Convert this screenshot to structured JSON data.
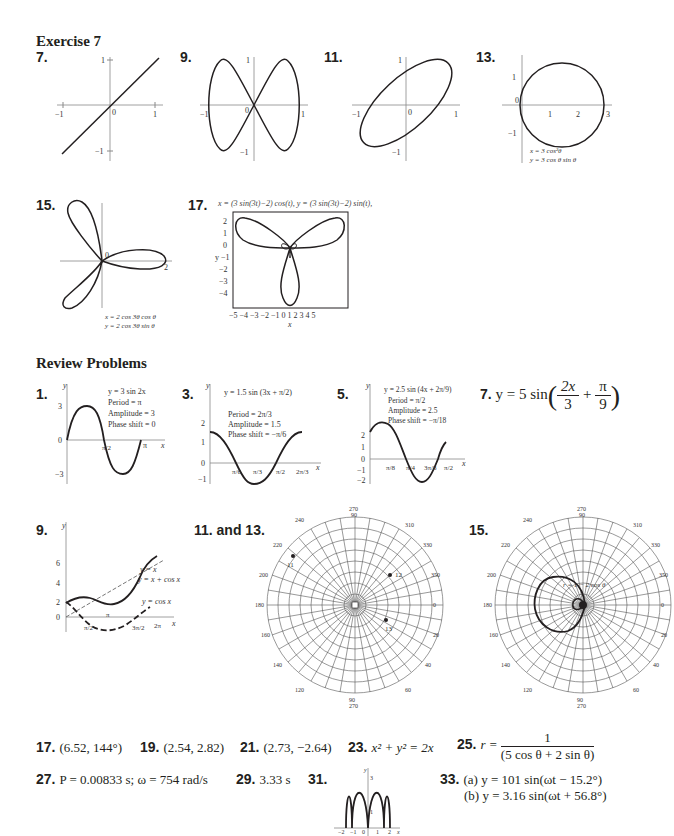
{
  "sections": {
    "exercise": "Exercise 7",
    "review": "Review Problems"
  },
  "exercise_figures": {
    "n7": {
      "label": "7.",
      "ticks": [
        "−1",
        "0",
        "1",
        "1",
        "−1"
      ]
    },
    "n9": {
      "label": "9.",
      "ticks": [
        "−1",
        "0",
        "1",
        "1",
        "−1"
      ]
    },
    "n11": {
      "label": "11.",
      "ticks": [
        "−1",
        "0",
        "1",
        "1",
        "−1"
      ]
    },
    "n13": {
      "label": "13.",
      "ticks": [
        "0",
        "1",
        "2",
        "3",
        "1",
        "−1"
      ],
      "eq1": "x = 3 cos²θ",
      "eq2": "y = 3 cos θ sin θ"
    },
    "n15": {
      "label": "15.",
      "ticks": [
        "0",
        "2"
      ],
      "eq1": "x = 2 cos 3θ cos θ",
      "eq2": "y = 2 cos 3θ sin θ"
    },
    "n17": {
      "label": "17.",
      "title": "x = (3 sin(3t)−2) cos(t), y = (3 sin(3t)−2) sin(t),",
      "ylabel": "y",
      "xlabel": "x",
      "yticks": [
        "2",
        "1",
        "0",
        "−1",
        "−2",
        "−3",
        "−4"
      ],
      "xticks": [
        "−5",
        "−4",
        "−3",
        "−2",
        "−1",
        "0",
        "1",
        "2",
        "3",
        "4",
        "5"
      ]
    }
  },
  "review_figures": {
    "n1": {
      "label": "1.",
      "eq": "y = 3 sin 2x",
      "period": "Period = π",
      "amp": "Amplitude = 3",
      "phase": "Phase shift = 0",
      "y": "y",
      "x": "x",
      "ticks": [
        "3",
        "0",
        "−3",
        "π/2",
        "π"
      ]
    },
    "n3": {
      "label": "3.",
      "eq": "y = 1.5 sin (3x + π/2)",
      "period": "Period = 2π/3",
      "amp": "Amplitude = 1.5",
      "phase": "Phase shift = −π/6",
      "y": "y",
      "x": "x",
      "ticks": [
        "2",
        "1",
        "0",
        "−1",
        "π/6",
        "π/3",
        "π/2",
        "2π/3"
      ]
    },
    "n5": {
      "label": "5.",
      "eq": "y = 2.5 sin (4x + 2π/9)",
      "period": "Period = π/2",
      "amp": "Amplitude = 2.5",
      "phase": "Phase shift = −π/18",
      "y": "y",
      "x": "x",
      "ticks": [
        "2",
        "1",
        "0",
        "−1",
        "−2",
        "π/8",
        "π/4",
        "3π/8",
        "π/2"
      ]
    },
    "n7": {
      "label": "7.",
      "lhs": "y = 5 sin",
      "num1": "2x",
      "den1": "3",
      "plus": "+",
      "num2": "π",
      "den2": "9"
    },
    "n9": {
      "label": "9.",
      "y": "y",
      "x": "x",
      "ticks": [
        "6",
        "4",
        "2",
        "0",
        "π/2",
        "π",
        "3π/2",
        "2π"
      ],
      "legend": [
        "y = x",
        "y = x + cos x",
        "y = cos x"
      ]
    },
    "n11_13": {
      "label": "11. and 13.",
      "points": [
        "11",
        "12",
        "13"
      ],
      "center": "0"
    },
    "n15": {
      "label": "15.",
      "curve": "r = 1 − 2 cos θ"
    },
    "polar_outer": [
      "270\n90",
      "280\n80",
      "290\n70",
      "300\n60",
      "310\n50",
      "320\n40",
      "330\n30",
      "340\n20",
      "350\n10",
      "0",
      "10\n350",
      "20\n340",
      "30\n330",
      "40\n320",
      "50\n310",
      "60\n300",
      "70\n290",
      "80\n280",
      "90\n270",
      "100\n260",
      "110\n250",
      "120\n240",
      "130\n230",
      "140\n220",
      "150\n210",
      "160\n200",
      "170\n190",
      "180",
      "190\n170",
      "200\n160",
      "210\n150",
      "220\n140",
      "230\n130",
      "240\n120",
      "250\n110",
      "260\n100"
    ]
  },
  "answers": {
    "a17": {
      "n": "17.",
      "v": "(6.52, 144°)"
    },
    "a19": {
      "n": "19.",
      "v": "(2.54, 2.82)"
    },
    "a21": {
      "n": "21.",
      "v": "(2.73, −2.64)"
    },
    "a23": {
      "n": "23.",
      "v": "x² + y² = 2x"
    },
    "a25": {
      "n": "25.",
      "lhs": "r =",
      "num": "1",
      "den": "(5 cos θ + 2 sin θ)"
    },
    "a27": {
      "n": "27.",
      "v": "P = 0.00833 s; ω = 754 rad/s"
    },
    "a29": {
      "n": "29.",
      "v": "3.33 s"
    },
    "a31": {
      "n": "31.",
      "ticks": [
        "3",
        "1",
        "−2",
        "−1",
        "0",
        "1",
        "2"
      ],
      "y": "y",
      "x": "x"
    },
    "a33": {
      "n": "33.",
      "a": "(a) y = 101 sin(ωt − 15.2°)",
      "b": "(b) y = 3.16 sin(ωt + 56.8°)"
    }
  }
}
